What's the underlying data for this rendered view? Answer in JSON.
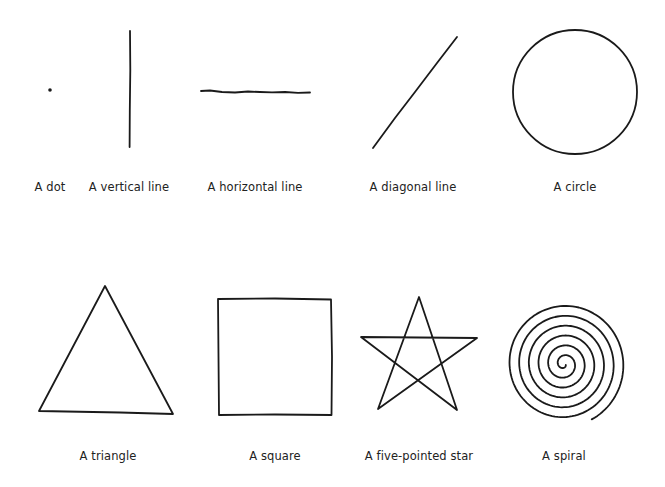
{
  "figure": {
    "rows": [
      {
        "items": [
          {
            "id": "dot",
            "label": "A dot",
            "label_x": 50,
            "label_y": 180
          },
          {
            "id": "vertical-line",
            "label": "A vertical line",
            "label_x": 129,
            "label_y": 180
          },
          {
            "id": "horizontal-line",
            "label": "A horizontal line",
            "label_x": 255,
            "label_y": 180
          },
          {
            "id": "diagonal-line",
            "label": "A diagonal line",
            "label_x": 413,
            "label_y": 180
          },
          {
            "id": "circle",
            "label": "A circle",
            "label_x": 575,
            "label_y": 180
          }
        ]
      },
      {
        "items": [
          {
            "id": "triangle",
            "label": "A triangle",
            "label_x": 108,
            "label_y": 449
          },
          {
            "id": "square",
            "label": "A square",
            "label_x": 275,
            "label_y": 449
          },
          {
            "id": "star",
            "label": "A five-pointed star",
            "label_x": 419,
            "label_y": 449
          },
          {
            "id": "spiral",
            "label": "A spiral",
            "label_x": 564,
            "label_y": 449
          }
        ]
      }
    ],
    "stroke_color": "#1a1a1a",
    "background": "#ffffff"
  }
}
